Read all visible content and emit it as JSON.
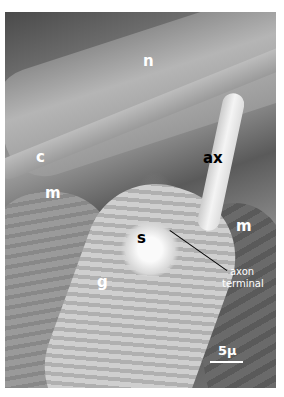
{
  "figure": {
    "type": "scanning electron micrograph",
    "labels": [
      {
        "id": "n",
        "text": "n"
      },
      {
        "id": "c",
        "text": "c"
      },
      {
        "id": "ax",
        "text": "ax"
      },
      {
        "id": "m_left",
        "text": "m"
      },
      {
        "id": "m_right",
        "text": "m"
      },
      {
        "id": "s",
        "text": "s"
      },
      {
        "id": "g",
        "text": "g"
      }
    ],
    "annotation": {
      "line1": "axon",
      "line2": "terminal"
    },
    "scale_bar": {
      "label": "5µ"
    }
  }
}
